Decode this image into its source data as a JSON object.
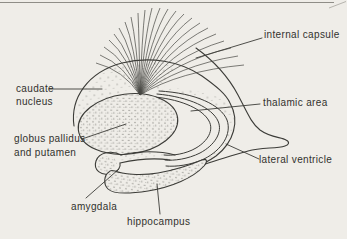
{
  "figure": {
    "type": "anatomical line diagram of basal ganglia and limbic structures",
    "background_color": "#efede8",
    "ink_color": "#3c3c38",
    "page_rule_color": "#8f8d87",
    "labels": {
      "internal_capsule": "internal capsule",
      "thalamic_area": "thalamic area",
      "lateral_ventricle": "lateral ventricle",
      "caudate_line1": "caudate",
      "caudate_line2": "nucleus",
      "globus_line1": "globus pallidus",
      "globus_line2": "and putamen",
      "amygdala": "amygdala",
      "hippocampus": "hippocampus"
    }
  }
}
